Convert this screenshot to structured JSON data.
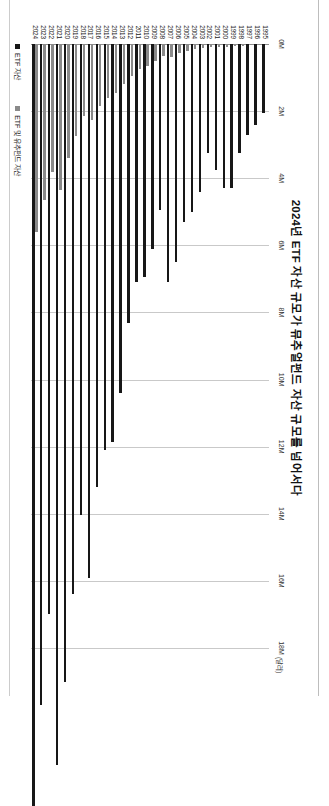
{
  "document": {
    "title": "2024년 ETF 자산 규모가 뮤추얼펀드 자산 규모를 넘어서다"
  },
  "legend": {
    "items": [
      {
        "label": "ETF 자산",
        "color": "#171717",
        "swatch": "legend-swatch-dark"
      },
      {
        "label": "ETF 및 유추펀드 자산",
        "color": "#8a8a8a",
        "swatch": "legend-swatch-gray"
      }
    ]
  },
  "axis": {
    "unit_label": "(달러)",
    "ticks": [
      "0M",
      "2M",
      "4M",
      "6M",
      "8M",
      "10M",
      "12M",
      "14M",
      "16M",
      "18M"
    ]
  },
  "chart_data": {
    "type": "bar",
    "orientation": "horizontal",
    "title": "2024년 ETF 자산 규모가 뮤추얼펀드 자산 규모를 넘어서다",
    "xlabel": "(달러)",
    "ylabel": "",
    "xlim": [
      0,
      18
    ],
    "xticks": [
      0,
      2,
      4,
      6,
      8,
      10,
      12,
      14,
      16,
      18
    ],
    "grid": true,
    "legend_position": "bottom-left",
    "categories": [
      "1995",
      "1996",
      "1997",
      "1998",
      "1999",
      "2000",
      "2001",
      "2002",
      "2003",
      "2004",
      "2005",
      "2006",
      "2007",
      "2008",
      "2009",
      "2010",
      "2011",
      "2012",
      "2013",
      "2014",
      "2015",
      "2016",
      "2017",
      "2018",
      "2019",
      "2020",
      "2021",
      "2022",
      "2023",
      "2024"
    ],
    "series": [
      {
        "name": "ETF 및 유추펀드 자산",
        "color": "#8a8a8a",
        "values": [
          0.02,
          0.03,
          0.04,
          0.05,
          0.07,
          0.08,
          0.09,
          0.1,
          0.12,
          0.15,
          0.2,
          0.28,
          0.38,
          0.35,
          0.5,
          0.65,
          0.75,
          0.95,
          1.2,
          1.45,
          1.6,
          1.85,
          2.25,
          2.15,
          2.75,
          3.4,
          4.35,
          3.8,
          4.65,
          5.6
        ]
      },
      {
        "name": "ETF 자산",
        "color": "#171717",
        "values": [
          2.05,
          2.4,
          2.7,
          3.25,
          4.3,
          4.3,
          3.75,
          3.25,
          4.4,
          5.0,
          5.3,
          6.5,
          7.1,
          4.95,
          6.1,
          6.95,
          7.1,
          8.3,
          10.4,
          11.85,
          12.1,
          13.2,
          15.9,
          14.05,
          16.4,
          19.0,
          21.5,
          17.0,
          19.7,
          22.7
        ]
      }
    ]
  }
}
